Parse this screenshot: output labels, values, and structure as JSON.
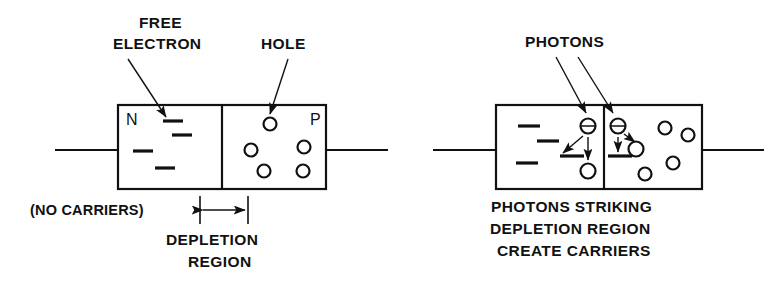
{
  "figure": {
    "background_color": "#ffffff",
    "ink_color": "#111111",
    "width": 777,
    "height": 281
  },
  "left_diagram": {
    "name": "pn-junction-no-light",
    "labels": {
      "free_electron_line1": "FREE",
      "free_electron_line2": "ELECTRON",
      "hole": "HOLE",
      "no_carriers": "(NO CARRIERS)",
      "depletion_line1": "DEPLETION",
      "depletion_line2": "REGION"
    },
    "region_letters": {
      "n_side": "N",
      "p_side": "P"
    },
    "counts": {
      "electron_dashes": 4,
      "holes": 5
    },
    "electron_dashes": [
      {
        "x": 163,
        "y": 121,
        "w": 20
      },
      {
        "x": 172,
        "y": 135,
        "w": 20
      },
      {
        "x": 133,
        "y": 151,
        "w": 20
      },
      {
        "x": 155,
        "y": 168,
        "w": 20
      }
    ],
    "holes": [
      {
        "cx": 270,
        "cy": 124,
        "r": 6.5
      },
      {
        "cx": 304,
        "cy": 147,
        "r": 6.5
      },
      {
        "cx": 251,
        "cy": 150,
        "r": 6.5
      },
      {
        "cx": 264,
        "cy": 171,
        "r": 6.5
      },
      {
        "cx": 303,
        "cy": 171,
        "r": 6.5
      }
    ],
    "box": {
      "x": 118,
      "y": 105,
      "w": 208,
      "h": 84,
      "junction_x": 222
    },
    "leads": {
      "left_x1": 55,
      "left_x2": 118,
      "right_x1": 326,
      "right_x2": 388,
      "y": 150
    },
    "depletion_markers": {
      "left_x": 200,
      "right_x": 248,
      "top_y": 196,
      "bottom_y": 224,
      "arrow_y": 210
    }
  },
  "right_diagram": {
    "name": "photodiode-photons-striking",
    "labels": {
      "photons": "PHOTONS",
      "caption_line1": "PHOTONS STRIKING",
      "caption_line2": "DEPLETION REGION",
      "caption_line3": "CREATE CARRIERS"
    },
    "counts": {
      "electron_dashes": 3,
      "electron_symbols": 2,
      "generated_holes": 2,
      "existing_holes": 4,
      "photon_arrows": 2
    },
    "electron_dashes": [
      {
        "x": 518,
        "y": 126,
        "w": 20
      },
      {
        "x": 537,
        "y": 141,
        "w": 20
      },
      {
        "x": 516,
        "y": 163,
        "w": 20
      }
    ],
    "electron_symbols": [
      {
        "cx": 588,
        "cy": 126,
        "r": 7.5
      },
      {
        "cx": 618,
        "cy": 126,
        "r": 7.5
      }
    ],
    "generated_holes": [
      {
        "cx": 588,
        "cy": 171,
        "r": 7.5
      },
      {
        "cx": 636,
        "cy": 149,
        "r": 7.5
      }
    ],
    "existing_holes": [
      {
        "cx": 665,
        "cy": 128,
        "r": 6.5
      },
      {
        "cx": 688,
        "cy": 135,
        "r": 6.5
      },
      {
        "cx": 673,
        "cy": 163,
        "r": 6.5
      },
      {
        "cx": 645,
        "cy": 174,
        "r": 6.5
      }
    ],
    "valence_bars": [
      {
        "x": 560,
        "y": 156,
        "w": 24
      },
      {
        "x": 608,
        "y": 156,
        "w": 24
      }
    ],
    "box": {
      "x": 496,
      "y": 105,
      "w": 206,
      "h": 84,
      "junction_x": 604
    },
    "leads": {
      "left_x1": 433,
      "left_x2": 496,
      "right_x1": 702,
      "right_x2": 764,
      "y": 150
    }
  }
}
